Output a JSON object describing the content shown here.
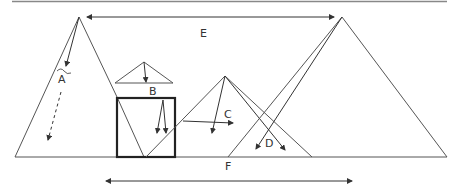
{
  "diagram": {
    "labels": {
      "A": "A",
      "B": "B",
      "C": "C",
      "D": "D",
      "E": "E",
      "F": "F"
    },
    "colors": {
      "stroke": "#555555",
      "box": "#222222",
      "border": "#888888"
    }
  }
}
